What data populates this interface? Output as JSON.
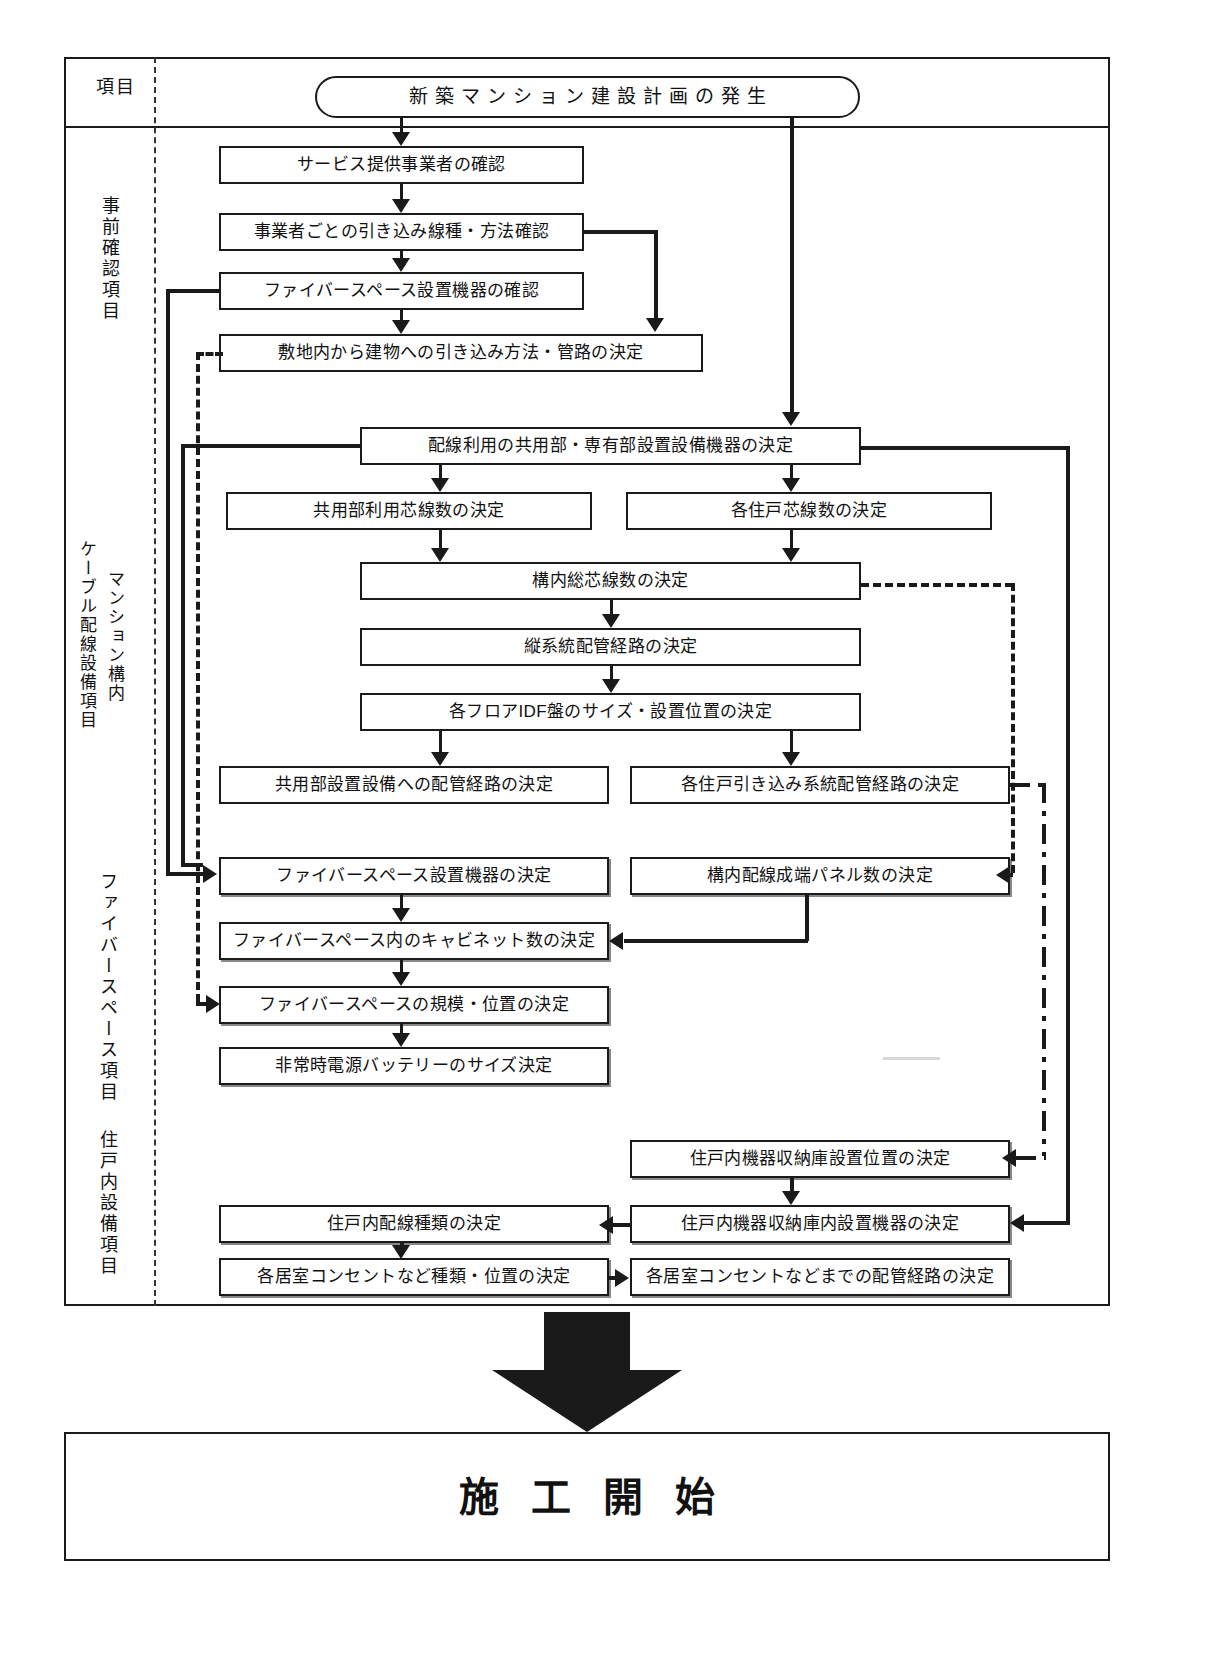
{
  "diagram": {
    "title_node": "新築マンション建設計画の発生",
    "terminal_node": "施工開始",
    "header_label": "項目",
    "sections": [
      {
        "id": "pre-check",
        "label": "事前確認項目",
        "label_lines": [
          "事前確認項目"
        ]
      },
      {
        "id": "building-cable",
        "label": "マンション構内ケーブル配線設備項目",
        "label_lines": [
          "マンション構内",
          "ケーブル配線設備項目"
        ]
      },
      {
        "id": "fiber-space",
        "label": "ファイバースペース項目",
        "label_lines": [
          "ファイバースペース項目"
        ]
      },
      {
        "id": "in-dwelling",
        "label": "住戸内設備項目",
        "label_lines": [
          "住戸内設備項目"
        ]
      }
    ],
    "nodes": {
      "n01": "サービス提供事業者の確認",
      "n02": "事業者ごとの引き込み線種・方法確認",
      "n03": "ファイバースペース設置機器の確認",
      "n04": "敷地内から建物への引き込み方法・管路の決定",
      "n05": "配線利用の共用部・専有部設置設備機器の決定",
      "n06": "共用部利用芯線数の決定",
      "n07": "各住戸芯線数の決定",
      "n08": "構内総芯線数の決定",
      "n09": "縦系統配管経路の決定",
      "n10": "各フロアIDF盤のサイズ・設置位置の決定",
      "n11": "共用部設置設備への配管経路の決定",
      "n12": "各住戸引き込み系統配管経路の決定",
      "n13": "ファイバースペース設置機器の決定",
      "n14": "構内配線成端パネル数の決定",
      "n15": "ファイバースペース内のキャビネット数の決定",
      "n16": "ファイバースペースの規模・位置の決定",
      "n17": "非常時電源バッテリーのサイズ決定",
      "n18": "住戸内機器収納庫設置位置の決定",
      "n19": "住戸内配線種類の決定",
      "n20": "住戸内機器収納庫内設置機器の決定",
      "n21": "各居室コンセントなど種類・位置の決定",
      "n22": "各居室コンセントなどまでの配管経路の決定"
    },
    "colors": {
      "line": "#1a1a1a",
      "background": "#ffffff",
      "shadow": "#888888"
    }
  }
}
